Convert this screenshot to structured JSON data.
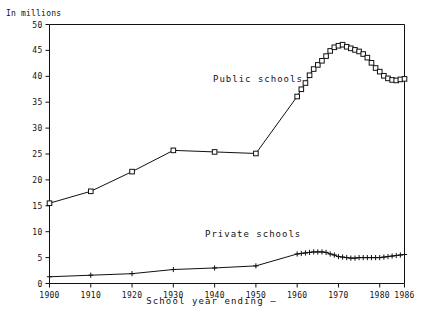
{
  "chart_data": {
    "type": "line",
    "title": "",
    "subtitle": "",
    "unit_label": "In millions",
    "xlabel": "School year ending –",
    "ylabel": "",
    "xlim": [
      1900,
      1986
    ],
    "ylim": [
      0,
      50
    ],
    "grid": false,
    "legend_position": "inline-annotation",
    "y_ticks": [
      "0",
      "5",
      "10",
      "15",
      "20",
      "25",
      "30",
      "35",
      "40",
      "45",
      "50"
    ],
    "y_tick_values": [
      0,
      5,
      10,
      15,
      20,
      25,
      30,
      35,
      40,
      45,
      50
    ],
    "x_ticks": [
      "1900",
      "1910",
      "1920",
      "1930",
      "1940",
      "1950",
      "1960",
      "1970",
      "1980",
      "1986"
    ],
    "x_tick_values": [
      1900,
      1910,
      1920,
      1930,
      1940,
      1950,
      1960,
      1970,
      1980,
      1986
    ],
    "series": [
      {
        "name": "Public schools",
        "marker": "square",
        "x": [
          1900,
          1910,
          1920,
          1930,
          1940,
          1950,
          1960,
          1961,
          1962,
          1963,
          1964,
          1965,
          1966,
          1967,
          1968,
          1969,
          1970,
          1971,
          1972,
          1973,
          1974,
          1975,
          1976,
          1977,
          1978,
          1979,
          1980,
          1981,
          1982,
          1983,
          1984,
          1985,
          1986
        ],
        "values": [
          15.5,
          17.8,
          21.6,
          25.7,
          25.4,
          25.1,
          36.1,
          37.5,
          38.7,
          40.2,
          41.4,
          42.2,
          43.0,
          43.9,
          44.9,
          45.6,
          45.9,
          46.1,
          45.7,
          45.4,
          45.1,
          44.8,
          44.3,
          43.6,
          42.6,
          41.6,
          40.9,
          40.1,
          39.6,
          39.3,
          39.2,
          39.4,
          39.5
        ]
      },
      {
        "name": "Private schools",
        "marker": "plus",
        "x": [
          1900,
          1910,
          1920,
          1930,
          1940,
          1950,
          1960,
          1961,
          1962,
          1963,
          1964,
          1965,
          1966,
          1967,
          1968,
          1969,
          1970,
          1971,
          1972,
          1973,
          1974,
          1975,
          1976,
          1977,
          1978,
          1979,
          1980,
          1981,
          1982,
          1983,
          1984,
          1985,
          1986
        ],
        "values": [
          1.3,
          1.6,
          1.9,
          2.7,
          3.0,
          3.4,
          5.7,
          5.8,
          5.9,
          6.0,
          6.1,
          6.1,
          6.1,
          6.0,
          5.7,
          5.5,
          5.2,
          5.1,
          5.0,
          4.9,
          4.9,
          5.0,
          5.0,
          5.0,
          5.0,
          5.0,
          5.0,
          5.1,
          5.2,
          5.3,
          5.4,
          5.5,
          5.6
        ]
      }
    ],
    "annotations": [
      {
        "text": "Public schools",
        "x": 1955,
        "y": 34
      },
      {
        "text": "Private schools",
        "x": 1953,
        "y": 8.8
      }
    ],
    "colors": {
      "line": "#111111",
      "background": "#ffffff",
      "axis": "#111111"
    }
  }
}
